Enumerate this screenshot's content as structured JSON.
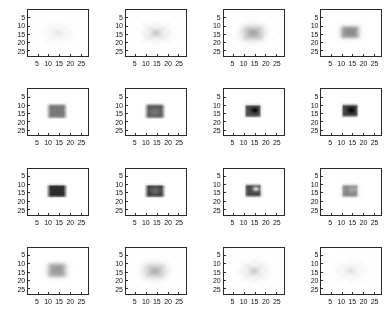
{
  "figure": {
    "type": "image-grid",
    "rows": 4,
    "cols": 4,
    "background": "#ffffff",
    "axis_color": "#2a2a2a",
    "tick_label_color": "#111111"
  },
  "axes": {
    "xticks": [
      5,
      10,
      15,
      20,
      25
    ],
    "yticks": [
      5,
      10,
      15,
      20,
      25
    ],
    "xlim": [
      0.5,
      28.5
    ],
    "ylim": [
      0.5,
      28.5
    ],
    "xlabel": "",
    "ylabel": "",
    "grid": false,
    "ydir": "reverse"
  },
  "chart_data": {
    "type": "heatmap",
    "title": "",
    "xlabel": "",
    "ylabel": "",
    "colormap": "gray-reversed",
    "image_size": [
      28,
      28
    ],
    "xticks": [
      5,
      10,
      15,
      20,
      25
    ],
    "yticks": [
      5,
      10,
      15,
      20,
      25
    ],
    "xlim": [
      0.5,
      28.5
    ],
    "ylim": [
      0.5,
      28.5
    ],
    "vmin": 0,
    "vmax": 1,
    "panel_count": 16,
    "panels": [
      {
        "index": 0,
        "row": 0,
        "col": 0,
        "pattern": "faint-ring",
        "peak_intensity": 0.06,
        "center": [
          14.5,
          14.5
        ],
        "block": {
          "x0": 10,
          "x1": 19,
          "y0": 10,
          "y1": 18
        },
        "blur": 2.6,
        "ringing": 0.9,
        "spots": []
      },
      {
        "index": 1,
        "row": 0,
        "col": 1,
        "pattern": "faint-ring",
        "peak_intensity": 0.13,
        "center": [
          14.5,
          14.5
        ],
        "block": {
          "x0": 10,
          "x1": 19,
          "y0": 10,
          "y1": 18
        },
        "blur": 2.3,
        "ringing": 1.0,
        "spots": []
      },
      {
        "index": 2,
        "row": 0,
        "col": 2,
        "pattern": "diffuse-blob",
        "peak_intensity": 0.3,
        "center": [
          14.0,
          14.5
        ],
        "block": {
          "x0": 10,
          "x1": 19,
          "y0": 10,
          "y1": 18
        },
        "blur": 2.0,
        "ringing": 0.35,
        "spots": []
      },
      {
        "index": 3,
        "row": 0,
        "col": 3,
        "pattern": "soft-block",
        "peak_intensity": 0.44,
        "center": [
          14.0,
          14.0
        ],
        "block": {
          "x0": 10,
          "x1": 18,
          "y0": 10,
          "y1": 17
        },
        "blur": 1.1,
        "ringing": 0.12,
        "spots": []
      },
      {
        "index": 4,
        "row": 1,
        "col": 0,
        "pattern": "solid-block",
        "peak_intensity": 0.52,
        "center": [
          14.0,
          14.0
        ],
        "block": {
          "x0": 10,
          "x1": 18,
          "y0": 10,
          "y1": 18
        },
        "blur": 0.5,
        "ringing": 0.05,
        "spots": []
      },
      {
        "index": 5,
        "row": 1,
        "col": 1,
        "pattern": "solid-block",
        "peak_intensity": 0.64,
        "center": [
          14.0,
          14.0
        ],
        "block": {
          "x0": 10,
          "x1": 18,
          "y0": 10,
          "y1": 18
        },
        "blur": 0.45,
        "ringing": 0.04,
        "spots": [
          {
            "x": 14.0,
            "y": 14.5,
            "radius": 1.6,
            "delta": -0.12
          }
        ]
      },
      {
        "index": 6,
        "row": 1,
        "col": 2,
        "pattern": "block-with-dark-dot",
        "peak_intensity": 0.7,
        "center": [
          14.0,
          13.8
        ],
        "block": {
          "x0": 11,
          "x1": 18,
          "y0": 10,
          "y1": 17
        },
        "blur": 0.4,
        "ringing": 0.03,
        "spots": [
          {
            "x": 14.8,
            "y": 13.4,
            "radius": 1.1,
            "delta": 0.3
          }
        ]
      },
      {
        "index": 7,
        "row": 1,
        "col": 3,
        "pattern": "block-with-dark-dot",
        "peak_intensity": 0.74,
        "center": [
          14.0,
          13.6
        ],
        "block": {
          "x0": 11,
          "x1": 18,
          "y0": 10,
          "y1": 17
        },
        "blur": 0.4,
        "ringing": 0.03,
        "spots": [
          {
            "x": 14.6,
            "y": 13.4,
            "radius": 1.2,
            "delta": 0.26
          }
        ]
      },
      {
        "index": 8,
        "row": 2,
        "col": 0,
        "pattern": "dark-block",
        "peak_intensity": 0.82,
        "center": [
          14.0,
          13.8
        ],
        "block": {
          "x0": 10,
          "x1": 18,
          "y0": 10,
          "y1": 17
        },
        "blur": 0.4,
        "ringing": 0.03,
        "spots": []
      },
      {
        "index": 9,
        "row": 2,
        "col": 1,
        "pattern": "dark-block-streak",
        "peak_intensity": 0.78,
        "center": [
          14.0,
          13.8
        ],
        "block": {
          "x0": 10,
          "x1": 18,
          "y0": 10,
          "y1": 17
        },
        "blur": 0.4,
        "ringing": 0.03,
        "spots": [
          {
            "x": 14.2,
            "y": 13.6,
            "radius": 1.8,
            "delta": -0.22
          }
        ]
      },
      {
        "index": 10,
        "row": 2,
        "col": 2,
        "pattern": "dark-block-bright-spot",
        "peak_intensity": 0.72,
        "center": [
          14.2,
          13.6
        ],
        "block": {
          "x0": 11,
          "x1": 18,
          "y0": 10,
          "y1": 17
        },
        "blur": 0.4,
        "ringing": 0.03,
        "spots": [
          {
            "x": 15.4,
            "y": 12.6,
            "radius": 1.0,
            "delta": -0.66
          }
        ]
      },
      {
        "index": 11,
        "row": 2,
        "col": 3,
        "pattern": "medium-block",
        "peak_intensity": 0.48,
        "center": [
          14.0,
          13.8
        ],
        "block": {
          "x0": 11,
          "x1": 18,
          "y0": 10,
          "y1": 17
        },
        "blur": 0.6,
        "ringing": 0.04,
        "spots": [
          {
            "x": 15.0,
            "y": 13.0,
            "radius": 1.3,
            "delta": -0.16
          }
        ]
      },
      {
        "index": 12,
        "row": 3,
        "col": 0,
        "pattern": "soft-block",
        "peak_intensity": 0.38,
        "center": [
          14.0,
          14.0
        ],
        "block": {
          "x0": 10,
          "x1": 18,
          "y0": 10,
          "y1": 18
        },
        "blur": 1.3,
        "ringing": 0.1,
        "spots": []
      },
      {
        "index": 13,
        "row": 3,
        "col": 1,
        "pattern": "diffuse-blob",
        "peak_intensity": 0.26,
        "center": [
          14.0,
          14.5
        ],
        "block": {
          "x0": 10,
          "x1": 19,
          "y0": 10,
          "y1": 18
        },
        "blur": 2.1,
        "ringing": 0.4,
        "spots": []
      },
      {
        "index": 14,
        "row": 3,
        "col": 2,
        "pattern": "faint-ring",
        "peak_intensity": 0.12,
        "center": [
          14.5,
          14.5
        ],
        "block": {
          "x0": 10,
          "x1": 19,
          "y0": 10,
          "y1": 18
        },
        "blur": 2.4,
        "ringing": 1.0,
        "spots": []
      },
      {
        "index": 15,
        "row": 3,
        "col": 3,
        "pattern": "faint-ring",
        "peak_intensity": 0.07,
        "center": [
          14.5,
          14.5
        ],
        "block": {
          "x0": 10,
          "x1": 19,
          "y0": 10,
          "y1": 18
        },
        "blur": 2.7,
        "ringing": 1.0,
        "spots": []
      }
    ]
  }
}
